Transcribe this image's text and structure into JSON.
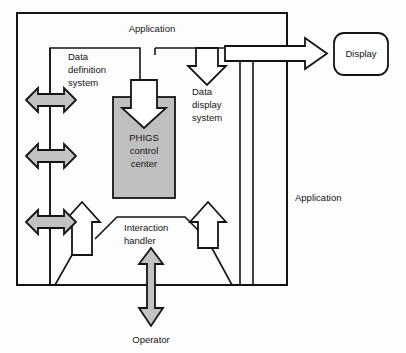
{
  "diagram": {
    "background_color": "#fdfdfd",
    "line_color": "#141414",
    "gray_fill": "#c2c2c2",
    "box_gray_fill": "#bfbfbf",
    "labels": {
      "application_top": "Application",
      "application_right": "Application",
      "data_definition_system": "Data\ndefinition\nsystem",
      "data_definition_line1": "Data",
      "data_definition_line2": "definition",
      "data_definition_line3": "system",
      "data_display_line1": "Data",
      "data_display_line2": "display",
      "data_display_line3": "system",
      "phigs_line1": "PHIGS",
      "phigs_line2": "control",
      "phigs_line3": "center",
      "interaction_line1": "Interaction",
      "interaction_line2": "handler",
      "display": "Display",
      "operator": "Operator"
    },
    "nodes": [
      {
        "id": "application-frame",
        "label": "Application",
        "shape": "rectangle"
      },
      {
        "id": "data-definition-system",
        "label": "Data definition system",
        "shape": "open-rectangle"
      },
      {
        "id": "phigs-control-center",
        "label": "PHIGS control center",
        "shape": "filled-rectangle",
        "fill": "#bfbfbf"
      },
      {
        "id": "data-display-system",
        "label": "Data display system",
        "shape": "open-rectangle"
      },
      {
        "id": "interaction-handler",
        "label": "Interaction handler",
        "shape": "open-polygon"
      },
      {
        "id": "display",
        "label": "Display",
        "shape": "rounded-rectangle"
      },
      {
        "id": "operator",
        "label": "Operator",
        "shape": "label"
      }
    ],
    "connectors": [
      {
        "id": "app-to-datadef-1",
        "style": "gray-double-arrow",
        "orientation": "horizontal"
      },
      {
        "id": "app-to-datadef-2",
        "style": "gray-double-arrow",
        "orientation": "horizontal"
      },
      {
        "id": "app-to-interaction",
        "style": "gray-double-arrow",
        "orientation": "horizontal"
      },
      {
        "id": "datadef-to-phigs",
        "style": "hollow-arrow",
        "orientation": "down"
      },
      {
        "id": "app-to-datadisplay",
        "style": "hollow-arrow",
        "orientation": "down"
      },
      {
        "id": "datadisplay-to-display",
        "style": "hollow-arrow",
        "orientation": "right"
      },
      {
        "id": "interaction-to-phigs",
        "style": "hollow-arrow",
        "orientation": "up"
      },
      {
        "id": "interaction-to-app",
        "style": "hollow-arrow",
        "orientation": "up"
      },
      {
        "id": "operator-to-interaction",
        "style": "gray-double-arrow",
        "orientation": "vertical"
      }
    ]
  }
}
